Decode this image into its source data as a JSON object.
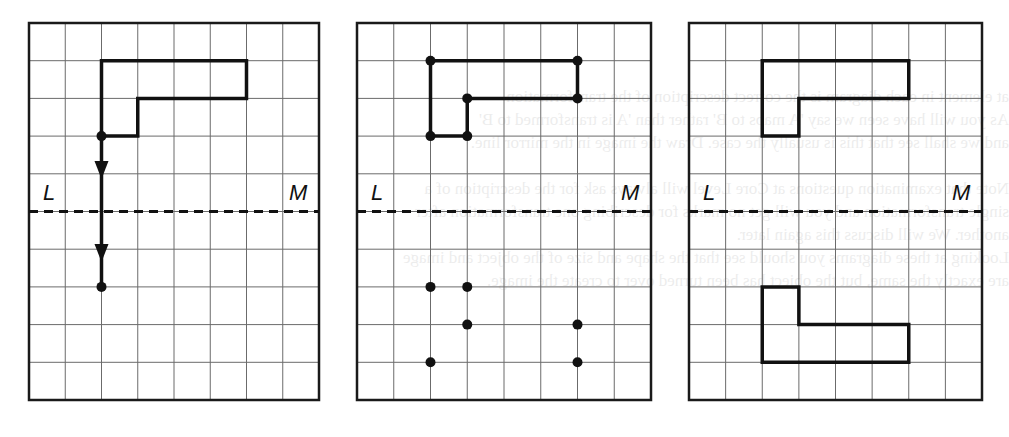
{
  "figure": {
    "grid": {
      "columns": 8,
      "rows": 10,
      "mirror_row": 5
    },
    "mirror_line": {
      "left_label": "L",
      "right_label": "M"
    },
    "colors": {
      "grid_line": "#6b6b6b",
      "border": "#1a1a1a",
      "shape": "#111111",
      "background": "#ffffff"
    },
    "panels": [
      {
        "id": "panel-1",
        "description": "Object with perpendicular line from corner to mirror, extended equal distance beyond",
        "object_vertices": [
          [
            2,
            1
          ],
          [
            6,
            1
          ],
          [
            6,
            2
          ],
          [
            3,
            2
          ],
          [
            3,
            3
          ],
          [
            2,
            3
          ]
        ],
        "construction_line": {
          "from": [
            2,
            3
          ],
          "to": [
            2,
            7
          ],
          "arrowheads_at_row": [
            3.9,
            6.1
          ]
        },
        "points": [
          [
            2,
            3
          ],
          [
            2,
            7
          ]
        ]
      },
      {
        "id": "panel-2",
        "description": "All object vertices marked and their reflected image points plotted",
        "object_vertices": [
          [
            2,
            1
          ],
          [
            6,
            1
          ],
          [
            6,
            2
          ],
          [
            3,
            2
          ],
          [
            3,
            3
          ],
          [
            2,
            3
          ]
        ],
        "object_points": [
          [
            2,
            1
          ],
          [
            6,
            1
          ],
          [
            6,
            2
          ],
          [
            3,
            2
          ],
          [
            3,
            3
          ],
          [
            2,
            3
          ]
        ],
        "image_points": [
          [
            2,
            7
          ],
          [
            3,
            7
          ],
          [
            3,
            8
          ],
          [
            6,
            8
          ],
          [
            2,
            9
          ],
          [
            6,
            9
          ]
        ]
      },
      {
        "id": "panel-3",
        "description": "Completed reflection of the object in mirror line LM",
        "object_vertices": [
          [
            2,
            1
          ],
          [
            6,
            1
          ],
          [
            6,
            2
          ],
          [
            3,
            2
          ],
          [
            3,
            3
          ],
          [
            2,
            3
          ]
        ],
        "image_vertices": [
          [
            2,
            7
          ],
          [
            3,
            7
          ],
          [
            3,
            8
          ],
          [
            6,
            8
          ],
          [
            6,
            9
          ],
          [
            2,
            9
          ]
        ]
      }
    ]
  },
  "background_bleed_text": [
    "at element in each diagram is the correct description of the transformation",
    "As you will have seen we say 'A maps to B' rather than 'A is transformed to B'",
    "and we shall see that this is usually the case. Draw the image in the mirror line.",
    "Note that examination questions at Core Level will always ask for the description of a",
    "single transformation and you will get no marks for describing one transformation after",
    "another. We will discuss this again later.",
    "Looking at these diagrams you should see that the shape and size of the object and image",
    "are exactly the same, but the object has been turned over to create the image."
  ]
}
